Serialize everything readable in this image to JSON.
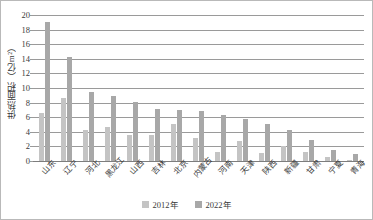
{
  "chart_data": {
    "type": "bar",
    "title": "",
    "xlabel": "",
    "ylabel": "供热面积（亿m²）",
    "ylim": [
      0,
      20
    ],
    "ytick_step": 2,
    "yticks": [
      0,
      2,
      4,
      6,
      8,
      10,
      12,
      14,
      16,
      18,
      20
    ],
    "grid": true,
    "legend_position": "bottom-center",
    "categories": [
      "山东",
      "辽宁",
      "河北",
      "黑龙江",
      "山西",
      "吉林",
      "北京",
      "内蒙古",
      "河南",
      "天津",
      "陕西",
      "新疆",
      "甘肃",
      "宁夏",
      "青海"
    ],
    "series": [
      {
        "name": "2012年",
        "color": "#c4c4c4",
        "values": [
          6.6,
          8.6,
          4.3,
          4.7,
          3.5,
          3.6,
          5.1,
          3.2,
          1.3,
          2.8,
          1.1,
          2.0,
          1.2,
          0.5,
          0.1
        ]
      },
      {
        "name": "2022年",
        "color": "#a8a8a8",
        "values": [
          19.1,
          14.3,
          9.5,
          8.9,
          8.1,
          7.1,
          7.0,
          6.8,
          6.3,
          5.8,
          5.1,
          4.3,
          2.9,
          1.5,
          1.0
        ]
      }
    ]
  }
}
